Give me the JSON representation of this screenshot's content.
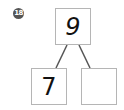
{
  "problem": {
    "number_badge": "18",
    "whole": "9",
    "part_left": "7",
    "part_right": ""
  },
  "colors": {
    "box_border": "#b5b5b5",
    "connector": "#555555",
    "badge_bg": "#555555"
  }
}
